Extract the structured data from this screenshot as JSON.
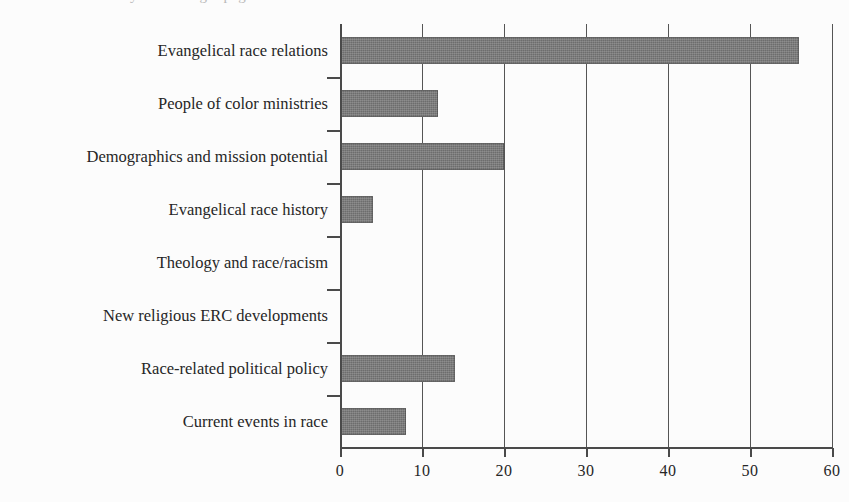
{
  "page": {
    "background_color": "#fcfcfc",
    "cropped_title_fragment": "y of the single-page article"
  },
  "chart_data": {
    "type": "bar",
    "orientation": "horizontal",
    "title": "",
    "subtitle": "",
    "xlabel": "",
    "ylabel": "",
    "categories": [
      "Evangelical race relations",
      "People of color ministries",
      "Demographics and mission potential",
      "Evangelical race history",
      "Theology and race/racism",
      "New religious ERC developments",
      "Race-related political policy",
      "Current events in race"
    ],
    "values": [
      56,
      12,
      20,
      4,
      0,
      0,
      14,
      8
    ],
    "xlim": [
      0,
      60
    ],
    "xticks": [
      0,
      10,
      20,
      30,
      40,
      50,
      60
    ],
    "xtick_labels": [
      "0",
      "10",
      "20",
      "30",
      "40",
      "50",
      "60"
    ],
    "grid": true,
    "grid_axis": "x",
    "legend": false,
    "bar_color": "#6d6d6d",
    "axis_color": "#4a4a4a"
  }
}
